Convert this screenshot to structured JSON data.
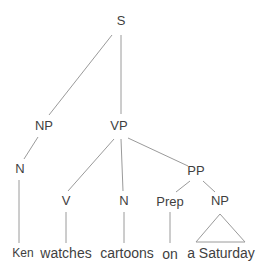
{
  "diagram": {
    "type": "syntax-tree",
    "sentence": "Ken watches cartoons on a Saturday",
    "labels": {
      "s": "S",
      "np_subject": "NP",
      "vp": "VP",
      "n_subject": "N",
      "v": "V",
      "n_object": "N",
      "pp": "PP",
      "prep": "Prep",
      "np_pp": "NP"
    },
    "words": {
      "ken": "Ken",
      "watches": "watches",
      "cartoons": "cartoons",
      "on": "on",
      "a_saturday": "a Saturday"
    },
    "colors": {
      "line": "#9a9a9a",
      "text": "#3f3f3f",
      "background": "#ffffff"
    }
  }
}
